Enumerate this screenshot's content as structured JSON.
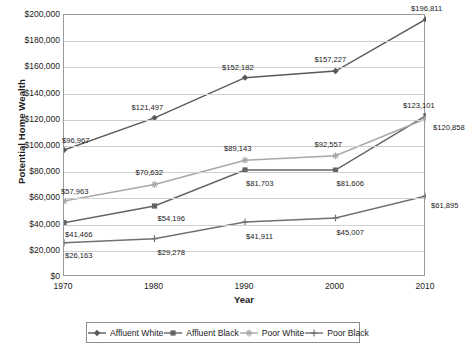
{
  "chart_data": {
    "type": "line",
    "title": "",
    "xlabel": "Year",
    "ylabel": "Potential Home Wealth",
    "x": [
      1970,
      1980,
      1990,
      2000,
      2010
    ],
    "xtick_labels": [
      "1970",
      "1980",
      "1990",
      "2000",
      "2010"
    ],
    "ylim": [
      0,
      200000
    ],
    "ytick_values": [
      0,
      20000,
      40000,
      60000,
      80000,
      100000,
      120000,
      140000,
      160000,
      180000,
      200000
    ],
    "ytick_labels": [
      "$0",
      "$20,000",
      "$40,000",
      "$60,000",
      "$80,000",
      "$100,000",
      "$120,000",
      "$140,000",
      "$160,000",
      "$180,000",
      "$200,000"
    ],
    "grid": "horizontal",
    "legend_position": "bottom",
    "series": [
      {
        "name": "Affluent White",
        "marker": "diamond",
        "color": "#5a5a5a",
        "values": [
          96967,
          121497,
          152182,
          157227,
          196811
        ],
        "data_labels": [
          "$96,967",
          "$121,497",
          "$152,182",
          "$157,227",
          "$196,811"
        ]
      },
      {
        "name": "Affluent Black",
        "marker": "square",
        "color": "#646464",
        "values": [
          41466,
          54196,
          81703,
          81606,
          123101
        ],
        "data_labels": [
          "$41,466",
          "$54,196",
          "$81,703",
          "$81,606",
          "$123,101"
        ]
      },
      {
        "name": "Poor White",
        "marker": "star",
        "color": "#a8a8a8",
        "values": [
          57963,
          70632,
          89143,
          92557,
          120858
        ],
        "data_labels": [
          "$57,963",
          "$70,632",
          "$89,143",
          "$92,557",
          "$120,858"
        ]
      },
      {
        "name": "Poor Black",
        "marker": "cross",
        "color": "#707070",
        "values": [
          26163,
          29278,
          41911,
          45007,
          61895
        ],
        "data_labels": [
          "$26,163",
          "$29,278",
          "$41,911",
          "$45,007",
          "$61,895"
        ]
      }
    ],
    "label_offsets": [
      [
        [
          -1,
          -12
        ],
        [
          -22,
          -13
        ],
        [
          -22,
          -13
        ],
        [
          -20,
          -14
        ],
        [
          -14,
          -13
        ]
      ],
      [
        [
          2,
          9
        ],
        [
          4,
          10
        ],
        [
          2,
          11
        ],
        [
          2,
          11
        ],
        [
          -22,
          -13
        ]
      ],
      [
        [
          -2,
          -12
        ],
        [
          -18,
          -14
        ],
        [
          -20,
          -14
        ],
        [
          -20,
          -14
        ],
        [
          8,
          6
        ]
      ],
      [
        [
          2,
          10
        ],
        [
          4,
          11
        ],
        [
          2,
          12
        ],
        [
          2,
          12
        ],
        [
          6,
          7
        ]
      ]
    ]
  }
}
